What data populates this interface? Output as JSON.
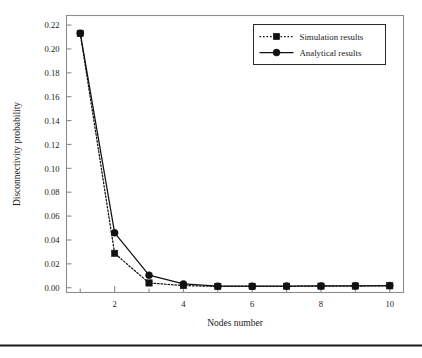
{
  "figure": {
    "background": "#ffffff",
    "axis_color": "#8d8d8d",
    "series_color": "#111111",
    "footer_rule_color": "#1a1a1a"
  },
  "chart_data": {
    "type": "line",
    "title": "",
    "xlabel": "Nodes number",
    "ylabel": "Disconnectivity probability",
    "x": [
      1,
      2,
      3,
      4,
      5,
      6,
      7,
      8,
      9,
      10
    ],
    "xlim": [
      0.6,
      10.4
    ],
    "ylim": [
      -0.004,
      0.228
    ],
    "xticks_major": [
      2,
      4,
      6,
      8,
      10
    ],
    "xticks_major_labels": [
      "2",
      "4",
      "6",
      "8",
      "10"
    ],
    "xticks_minor": [
      1,
      3,
      5,
      7,
      9
    ],
    "yticks": [
      0.0,
      0.02,
      0.04,
      0.06,
      0.08,
      0.1,
      0.12,
      0.14,
      0.16,
      0.18,
      0.2,
      0.22
    ],
    "ytick_labels": [
      "0.00",
      "0.02",
      "0.04",
      "0.06",
      "0.08",
      "0.10",
      "0.12",
      "0.14",
      "0.16",
      "0.18",
      "0.20",
      "0.22"
    ],
    "grid": false,
    "legend_position": "top-right",
    "series": [
      {
        "name": "Simulation results",
        "marker": "square",
        "linestyle": "dotted",
        "color": "#111111",
        "values": [
          0.213,
          0.0288,
          0.004,
          0.0018,
          0.0011,
          0.0011,
          0.0012,
          0.0013,
          0.0014,
          0.0016
        ]
      },
      {
        "name": "Analytical results",
        "marker": "circle",
        "linestyle": "solid",
        "color": "#111111",
        "values": [
          0.2132,
          0.046,
          0.0105,
          0.0032,
          0.0013,
          0.0013,
          0.0014,
          0.0015,
          0.0016,
          0.0018
        ]
      }
    ]
  },
  "legend": {
    "entries": [
      {
        "label": "Simulation results"
      },
      {
        "label": "Analytical results"
      }
    ]
  }
}
